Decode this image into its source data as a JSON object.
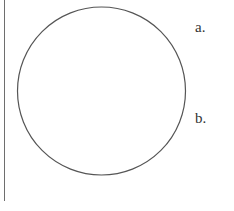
{
  "diagram": {
    "labels": [
      {
        "id": "a",
        "text": "a."
      },
      {
        "id": "b",
        "text": "b."
      }
    ],
    "shape": "circle",
    "stroke_color": "#555555",
    "line_color": "#6e6e6e"
  }
}
